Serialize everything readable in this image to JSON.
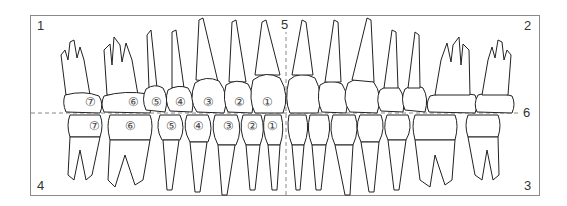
{
  "diagram": {
    "frame_color": "#8a8a8a",
    "line_color": "#222222",
    "dash_color": "#888888",
    "corner_labels": {
      "top_left": "1",
      "top_right": "2",
      "bottom_right": "3",
      "bottom_left": "4",
      "midline_top": "5",
      "occlusal_right": "6"
    },
    "upper_teeth_labels": [
      "⑦",
      "⑥",
      "⑤",
      "④",
      "③",
      "②",
      "①"
    ],
    "lower_teeth_labels": [
      "⑦",
      "⑥",
      "⑤",
      "④",
      "③",
      "②",
      "①"
    ],
    "upper_label_positions": [
      [
        91,
        103
      ],
      [
        134,
        103
      ],
      [
        157,
        103
      ],
      [
        181,
        103
      ],
      [
        209,
        103
      ],
      [
        240,
        103
      ],
      [
        268,
        103
      ]
    ],
    "lower_label_positions": [
      [
        95,
        127
      ],
      [
        131,
        127
      ],
      [
        172,
        127
      ],
      [
        199,
        127
      ],
      [
        229,
        127
      ],
      [
        253,
        127
      ],
      [
        273,
        127
      ]
    ]
  }
}
